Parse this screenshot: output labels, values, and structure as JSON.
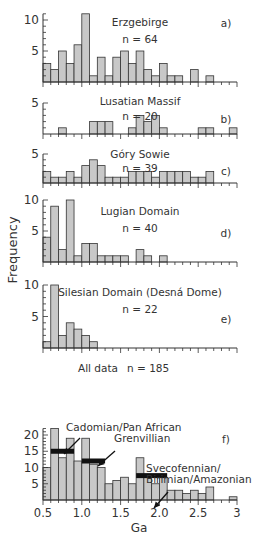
{
  "figure": {
    "ylabel": "Frequency",
    "xlabel": "Ga",
    "x_ticks": [
      "0.5",
      "1.0",
      "1.5",
      "2.0",
      "2.5",
      "3"
    ]
  },
  "chart_data": [
    {
      "type": "bar",
      "panel": "a)",
      "title": "Erzgebirge",
      "n_label": "n = 64",
      "bin_start": 0.5,
      "bin_width": 0.1,
      "values": [
        3,
        2,
        5,
        3,
        6,
        11,
        1,
        4,
        1,
        4,
        5,
        3,
        5,
        2,
        1,
        3,
        1,
        1,
        0,
        2,
        0,
        1,
        0,
        0,
        0
      ],
      "yticks": [
        5,
        10
      ],
      "ylim": [
        0,
        11
      ],
      "xlabel": "",
      "ylabel": "Frequency"
    },
    {
      "type": "bar",
      "panel": "b)",
      "title": "Lusatian Massif",
      "n_label": "n = 20",
      "bin_start": 0.5,
      "bin_width": 0.1,
      "values": [
        0,
        0,
        1,
        0,
        0,
        0,
        2,
        2,
        2,
        0,
        0,
        1,
        3,
        2,
        3,
        1,
        0,
        0,
        0,
        0,
        1,
        1,
        0,
        0,
        1
      ],
      "yticks": [
        5
      ],
      "ylim": [
        0,
        5
      ]
    },
    {
      "type": "bar",
      "panel": "c)",
      "title": "Góry Sowie",
      "n_label": "n = 39",
      "bin_start": 0.5,
      "bin_width": 0.1,
      "values": [
        2,
        1,
        1,
        2,
        1,
        3,
        4,
        3,
        1,
        1,
        1,
        2,
        2,
        2,
        1,
        2,
        2,
        2,
        2,
        1,
        1,
        2,
        0,
        0,
        0
      ],
      "yticks": [
        5
      ],
      "ylim": [
        0,
        5
      ]
    },
    {
      "type": "bar",
      "panel": "d)",
      "title": "Lugian Domain",
      "n_label": "n = 40",
      "bin_start": 0.5,
      "bin_width": 0.1,
      "values": [
        4,
        9,
        2,
        10,
        1,
        3,
        3,
        1,
        1,
        1,
        1,
        0,
        2,
        1,
        0,
        1,
        0,
        0,
        0,
        0,
        0,
        0,
        0,
        0,
        0
      ],
      "yticks": [
        5,
        10
      ],
      "ylim": [
        0,
        10
      ]
    },
    {
      "type": "bar",
      "panel": "e)",
      "title": "Silesian Domain (Desná Dome)",
      "n_label": "n = 22",
      "bin_start": 0.5,
      "bin_width": 0.1,
      "values": [
        1,
        10,
        2,
        4,
        3,
        2,
        1,
        0,
        0,
        0,
        0,
        0,
        0,
        0,
        0,
        0,
        0,
        0,
        0,
        0,
        0,
        0,
        0,
        0,
        0
      ],
      "yticks": [
        5,
        10
      ],
      "ylim": [
        0,
        10
      ]
    },
    {
      "type": "bar",
      "panel": "f)",
      "title": "All data",
      "n_label": "n = 185",
      "bin_start": 0.5,
      "bin_width": 0.1,
      "values": [
        10,
        22,
        13,
        19,
        12,
        19,
        11,
        10,
        5,
        6,
        7,
        5,
        13,
        7,
        5,
        7,
        3,
        3,
        2,
        3,
        2,
        4,
        0,
        0,
        1
      ],
      "yticks": [
        5,
        10,
        15,
        20
      ],
      "ylim": [
        0,
        22
      ],
      "xlabel": "Ga",
      "xticks": [
        0.5,
        1.0,
        1.5,
        2.0,
        2.5,
        3.0
      ],
      "annotations": [
        {
          "text": "Cadomian/Pan African",
          "range": [
            0.6,
            0.9
          ],
          "level": 15
        },
        {
          "text": "Grenvillian",
          "range": [
            1.0,
            1.3
          ],
          "level": 12
        },
        {
          "text": "Svecofennian/",
          "text2": "Birimian/Amazonian",
          "range": [
            1.7,
            2.1
          ],
          "level": 7.5
        }
      ]
    }
  ]
}
